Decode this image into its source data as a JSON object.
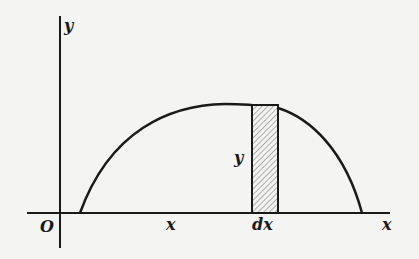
{
  "diagram": {
    "type": "area-under-curve",
    "labels": {
      "y_axis": "y",
      "origin": "O",
      "x_position": "x",
      "strip_width": "dx",
      "x_axis": "x",
      "strip_height": "y"
    },
    "colors": {
      "background": "#f4f4f2",
      "ink": "#1a1a1a",
      "hatch": "#555555"
    }
  }
}
